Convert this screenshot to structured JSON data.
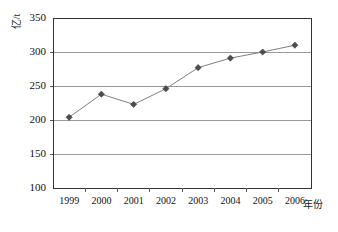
{
  "chart_data": {
    "type": "line",
    "title": "",
    "xlabel": "年份",
    "ylabel": "亿/t",
    "categories": [
      "1999",
      "2000",
      "2001",
      "2002",
      "2003",
      "2004",
      "2005",
      "2006"
    ],
    "values": [
      204,
      238,
      223,
      246,
      277,
      291,
      300,
      310
    ],
    "series": [
      {
        "name": "",
        "values": [
          204,
          238,
          223,
          246,
          277,
          291,
          300,
          310
        ]
      }
    ],
    "ylim": [
      100,
      350
    ],
    "yticks": [
      100,
      150,
      200,
      250,
      300,
      350
    ],
    "ytick_labels": [
      "100",
      "150",
      "200",
      "250",
      "300",
      "350"
    ],
    "grid": "horizontal",
    "legend": "none",
    "marker": "diamond",
    "line_color": "#808080",
    "marker_color": "#4d4d4d",
    "grid_color": "#999999",
    "frame_color": "#333333"
  },
  "axes": {
    "y_title": "亿/t",
    "x_title": "年份"
  }
}
